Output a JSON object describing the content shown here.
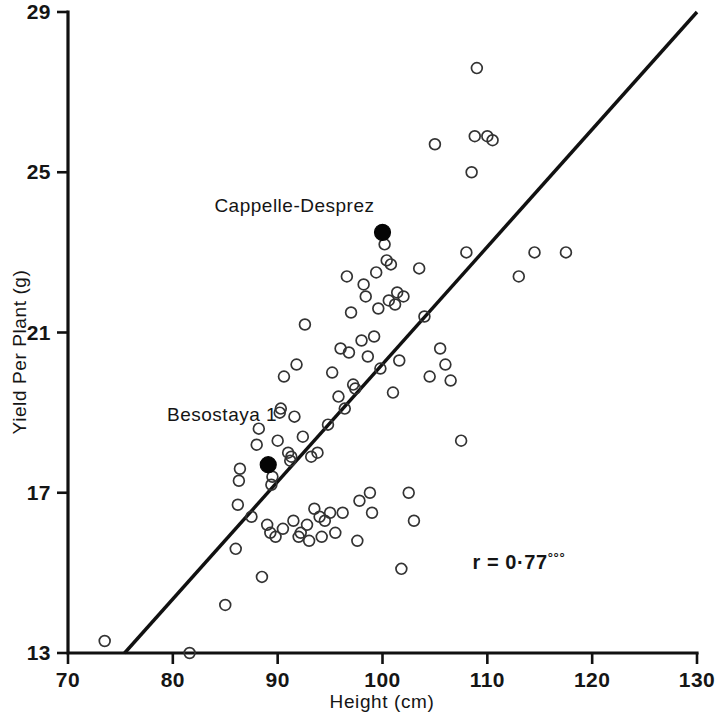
{
  "figure": {
    "background_color": "#ffffff",
    "ink_color": "#111111"
  },
  "axes": {
    "x": {
      "label": "Height (cm)",
      "min": 70,
      "max": 130,
      "tick_values": [
        70,
        80,
        90,
        100,
        110,
        120,
        130
      ],
      "tick_labels": [
        "70",
        "80",
        "90",
        "100",
        "110",
        "120",
        "130"
      ]
    },
    "y": {
      "label": "Yield Per Plant (g)",
      "min": 13,
      "max": 29,
      "tick_values": [
        13,
        17,
        21,
        25,
        29
      ],
      "tick_labels": [
        "13",
        "17",
        "21",
        "25",
        "29"
      ]
    }
  },
  "annotations": {
    "correlation": {
      "text": "r = 0·77",
      "superscript": "°°°",
      "x": 113,
      "y": 15.1
    },
    "labels": [
      {
        "name": "cappelle-desprez-label",
        "text": "Cappelle-Desprez",
        "x": 91.6,
        "y": 24.0
      },
      {
        "name": "besostaya-1-label",
        "text": "Besostaya 1",
        "x": 84.7,
        "y": 18.8
      }
    ]
  },
  "chart_data": {
    "type": "scatter",
    "title": "",
    "xlabel": "Height (cm)",
    "ylabel": "Yield Per Plant (g)",
    "xlim": [
      70,
      130
    ],
    "ylim": [
      13,
      29
    ],
    "grid": false,
    "legend": null,
    "correlation_r": 0.77,
    "significance": "***",
    "regression_line": {
      "x_start": 75.4,
      "y_start": 13.0,
      "x_end": 130.0,
      "y_end": 29.0
    },
    "series": [
      {
        "name": "Parent varieties (highlighted)",
        "marker": "filled-circle",
        "points": [
          {
            "label": "Cappelle-Desprez",
            "x": 100.0,
            "y": 23.5
          },
          {
            "label": "Besostaya 1",
            "x": 89.1,
            "y": 17.7
          }
        ]
      },
      {
        "name": "Progeny lines",
        "marker": "open-circle",
        "points": [
          {
            "x": 73.5,
            "y": 13.3
          },
          {
            "x": 81.6,
            "y": 13.0
          },
          {
            "x": 85.0,
            "y": 14.2
          },
          {
            "x": 86.0,
            "y": 15.6
          },
          {
            "x": 88.5,
            "y": 14.9
          },
          {
            "x": 86.2,
            "y": 16.7
          },
          {
            "x": 86.3,
            "y": 17.3
          },
          {
            "x": 86.4,
            "y": 17.6
          },
          {
            "x": 87.5,
            "y": 16.4
          },
          {
            "x": 88.0,
            "y": 18.2
          },
          {
            "x": 88.2,
            "y": 18.6
          },
          {
            "x": 89.0,
            "y": 16.2
          },
          {
            "x": 89.3,
            "y": 16.0
          },
          {
            "x": 89.4,
            "y": 17.2
          },
          {
            "x": 89.5,
            "y": 17.4
          },
          {
            "x": 89.8,
            "y": 15.9
          },
          {
            "x": 90.0,
            "y": 18.3
          },
          {
            "x": 90.2,
            "y": 19.0
          },
          {
            "x": 90.3,
            "y": 19.1
          },
          {
            "x": 90.5,
            "y": 16.1
          },
          {
            "x": 90.6,
            "y": 19.9
          },
          {
            "x": 91.0,
            "y": 18.0
          },
          {
            "x": 91.2,
            "y": 17.8
          },
          {
            "x": 91.3,
            "y": 17.9
          },
          {
            "x": 91.5,
            "y": 16.3
          },
          {
            "x": 91.6,
            "y": 18.9
          },
          {
            "x": 91.8,
            "y": 20.2
          },
          {
            "x": 92.0,
            "y": 15.9
          },
          {
            "x": 92.2,
            "y": 16.0
          },
          {
            "x": 92.4,
            "y": 18.4
          },
          {
            "x": 92.6,
            "y": 21.2
          },
          {
            "x": 92.8,
            "y": 16.2
          },
          {
            "x": 93.0,
            "y": 15.8
          },
          {
            "x": 93.2,
            "y": 17.9
          },
          {
            "x": 93.5,
            "y": 16.6
          },
          {
            "x": 93.8,
            "y": 18.0
          },
          {
            "x": 94.0,
            "y": 16.4
          },
          {
            "x": 94.2,
            "y": 15.9
          },
          {
            "x": 94.5,
            "y": 16.3
          },
          {
            "x": 94.8,
            "y": 18.7
          },
          {
            "x": 95.0,
            "y": 16.5
          },
          {
            "x": 95.2,
            "y": 20.0
          },
          {
            "x": 95.5,
            "y": 16.0
          },
          {
            "x": 95.8,
            "y": 19.4
          },
          {
            "x": 96.0,
            "y": 20.6
          },
          {
            "x": 96.2,
            "y": 16.5
          },
          {
            "x": 96.4,
            "y": 19.1
          },
          {
            "x": 96.6,
            "y": 22.4
          },
          {
            "x": 96.8,
            "y": 20.5
          },
          {
            "x": 97.0,
            "y": 21.5
          },
          {
            "x": 97.2,
            "y": 19.7
          },
          {
            "x": 97.4,
            "y": 19.6
          },
          {
            "x": 97.6,
            "y": 15.8
          },
          {
            "x": 97.8,
            "y": 16.8
          },
          {
            "x": 98.0,
            "y": 20.8
          },
          {
            "x": 98.2,
            "y": 22.2
          },
          {
            "x": 98.4,
            "y": 21.9
          },
          {
            "x": 98.6,
            "y": 20.4
          },
          {
            "x": 98.8,
            "y": 17.0
          },
          {
            "x": 99.0,
            "y": 16.5
          },
          {
            "x": 99.2,
            "y": 20.9
          },
          {
            "x": 99.4,
            "y": 22.5
          },
          {
            "x": 99.6,
            "y": 21.6
          },
          {
            "x": 99.8,
            "y": 20.1
          },
          {
            "x": 100.2,
            "y": 23.2
          },
          {
            "x": 100.4,
            "y": 22.8
          },
          {
            "x": 100.6,
            "y": 21.8
          },
          {
            "x": 100.8,
            "y": 22.7
          },
          {
            "x": 101.0,
            "y": 19.5
          },
          {
            "x": 101.2,
            "y": 21.7
          },
          {
            "x": 101.4,
            "y": 22.0
          },
          {
            "x": 101.6,
            "y": 20.3
          },
          {
            "x": 101.8,
            "y": 15.1
          },
          {
            "x": 102.0,
            "y": 21.9
          },
          {
            "x": 102.5,
            "y": 17.0
          },
          {
            "x": 103.0,
            "y": 16.3
          },
          {
            "x": 103.5,
            "y": 22.6
          },
          {
            "x": 104.0,
            "y": 21.4
          },
          {
            "x": 104.5,
            "y": 19.9
          },
          {
            "x": 105.0,
            "y": 25.7
          },
          {
            "x": 105.5,
            "y": 20.6
          },
          {
            "x": 106.0,
            "y": 20.2
          },
          {
            "x": 106.5,
            "y": 19.8
          },
          {
            "x": 107.5,
            "y": 18.3
          },
          {
            "x": 108.0,
            "y": 23.0
          },
          {
            "x": 108.5,
            "y": 25.0
          },
          {
            "x": 108.8,
            "y": 25.9
          },
          {
            "x": 109.0,
            "y": 27.6
          },
          {
            "x": 110.0,
            "y": 25.9
          },
          {
            "x": 110.5,
            "y": 25.8
          },
          {
            "x": 113.0,
            "y": 22.4
          },
          {
            "x": 114.5,
            "y": 23.0
          },
          {
            "x": 117.5,
            "y": 23.0
          }
        ]
      }
    ]
  }
}
